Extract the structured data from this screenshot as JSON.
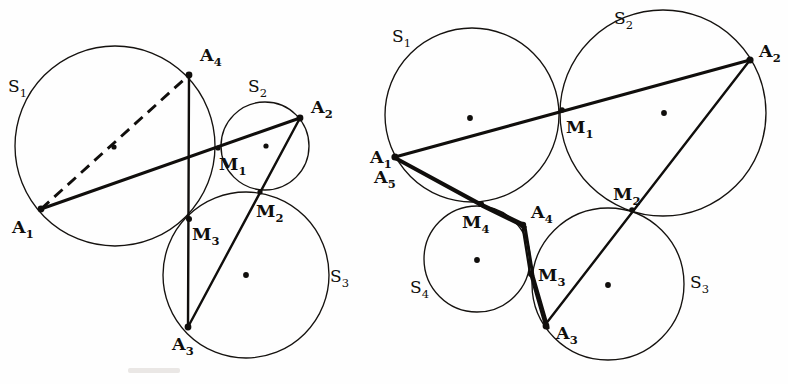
{
  "figure": {
    "width": 788,
    "height": 384,
    "background": "#ffffff",
    "stroke_color": "#100e0c"
  },
  "panels": [
    {
      "id": "left-panel",
      "name": "left-figure",
      "circles": [
        {
          "label": "S",
          "subscript": "1",
          "cx": 115,
          "cy": 146,
          "r": 100,
          "label_x": 8,
          "label_y": 92,
          "center_dot": {
            "x": 114,
            "y": 147
          },
          "center_dot_visible": true
        },
        {
          "label": "S",
          "subscript": "2",
          "cx": 265,
          "cy": 146,
          "r": 44,
          "label_x": 248,
          "label_y": 92,
          "center_dot": {
            "x": 266,
            "y": 146
          },
          "center_dot_visible": true
        },
        {
          "label": "S",
          "subscript": "3",
          "cx": 246,
          "cy": 275,
          "r": 83,
          "label_x": 330,
          "label_y": 282,
          "center_dot": {
            "x": 246,
            "y": 275
          },
          "center_dot_visible": true
        }
      ],
      "vertices": [
        {
          "label": "A",
          "subscript": "1",
          "x": 41,
          "y": 209,
          "label_x": 12,
          "label_y": 233
        },
        {
          "label": "A",
          "subscript": "2",
          "x": 300,
          "y": 118,
          "label_x": 311,
          "label_y": 113
        },
        {
          "label": "A",
          "subscript": "3",
          "x": 188,
          "y": 327,
          "label_x": 172,
          "label_y": 350
        },
        {
          "label": "A",
          "subscript": "4",
          "x": 189,
          "y": 75,
          "label_x": 200,
          "label_y": 61
        },
        {
          "label": "M",
          "subscript": "1",
          "x": 218,
          "y": 148,
          "label_x": 219,
          "label_y": 170
        },
        {
          "label": "M",
          "subscript": "2",
          "x": 260,
          "y": 192,
          "label_x": 256,
          "label_y": 217
        },
        {
          "label": "M",
          "subscript": "3",
          "x": 189,
          "y": 219,
          "label_x": 192,
          "label_y": 240
        }
      ],
      "segments": [
        {
          "name": "chain-a1-a2",
          "points": "41,209 300,118",
          "style": "solid-thick"
        },
        {
          "name": "chain-a2-a3",
          "points": "300,118 188,327",
          "style": "solid-thin"
        },
        {
          "name": "chain-a3-a4",
          "points": "188,327 189,75",
          "style": "solid-thin"
        },
        {
          "name": "diagonal-a1-a4-dashed",
          "points": "41,209 189,75",
          "style": "dashed"
        }
      ]
    },
    {
      "id": "right-panel",
      "name": "right-figure",
      "circles": [
        {
          "label": "S",
          "subscript": "1",
          "cx": 472,
          "cy": 115,
          "r": 87,
          "label_x": 392,
          "label_y": 42,
          "center_dot": {
            "x": 470,
            "y": 118
          },
          "center_dot_visible": true
        },
        {
          "label": "S",
          "subscript": "2",
          "cx": 663,
          "cy": 113,
          "r": 103,
          "label_x": 614,
          "label_y": 24,
          "center_dot": {
            "x": 664,
            "y": 113
          },
          "center_dot_visible": true
        },
        {
          "label": "S",
          "subscript": "3",
          "cx": 608,
          "cy": 284,
          "r": 76,
          "label_x": 690,
          "label_y": 288,
          "center_dot": {
            "x": 608,
            "y": 285
          },
          "center_dot_visible": true
        },
        {
          "label": "S",
          "subscript": "4",
          "cx": 477,
          "cy": 259,
          "r": 53,
          "label_x": 410,
          "label_y": 293,
          "center_dot": {
            "x": 477,
            "y": 260
          },
          "center_dot_visible": true
        }
      ],
      "vertices": [
        {
          "label": "A",
          "subscript": "1",
          "x": 395,
          "y": 157,
          "label_x": 372,
          "label_y": 158
        },
        {
          "label": "A",
          "subscript": "5",
          "x": 395,
          "y": 157,
          "label_x": 374,
          "label_y": 178
        },
        {
          "label": "A",
          "subscript": "2",
          "x": 750,
          "y": 60,
          "label_x": 759,
          "label_y": 57
        },
        {
          "label": "A",
          "subscript": "3",
          "x": 545,
          "y": 325,
          "label_x": 556,
          "label_y": 335
        },
        {
          "label": "A",
          "subscript": "4",
          "x": 522,
          "y": 223,
          "label_x": 528,
          "label_y": 215
        },
        {
          "label": "M",
          "subscript": "1",
          "x": 562,
          "y": 110,
          "label_x": 566,
          "label_y": 133
        },
        {
          "label": "M",
          "subscript": "2",
          "x": 632,
          "y": 210,
          "label_x": 616,
          "label_y": 199
        },
        {
          "label": "M",
          "subscript": "3",
          "x": 530,
          "y": 273,
          "label_x": 536,
          "label_y": 277
        },
        {
          "label": "M",
          "subscript": "4",
          "x": 480,
          "y": 203,
          "label_x": 464,
          "label_y": 226
        }
      ],
      "segments": [
        {
          "name": "chain-a1-a2",
          "points": "395,157 750,60",
          "style": "solid-thick"
        },
        {
          "name": "chain-a2-a3",
          "points": "750,60 545,325",
          "style": "solid-thin"
        },
        {
          "name": "chain-a3-m3-a4",
          "points": "545,325 530,273 522,223",
          "style": "solid-thin"
        },
        {
          "name": "chain-a4-m4-a5",
          "points": "522,223 480,203 395,157",
          "style": "solid-thin"
        },
        {
          "name": "chain-a5-m4-inner",
          "points": "395,157 481,205 524,226",
          "style": "solid-thick"
        },
        {
          "name": "chain-a4-m3-a3-inner",
          "points": "524,226 532,275 547,327",
          "style": "solid-thick"
        }
      ]
    }
  ],
  "caption": ""
}
